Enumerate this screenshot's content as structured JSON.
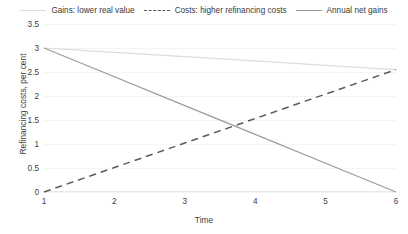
{
  "chart_data": {
    "type": "line",
    "title": "",
    "xlabel": "Time",
    "ylabel": "Refinancing costs, per cent",
    "x": [
      1,
      2,
      3,
      4,
      5,
      6
    ],
    "xlim": [
      1,
      6
    ],
    "ylim": [
      0,
      3.5
    ],
    "xticks": [
      "1",
      "2",
      "3",
      "4",
      "5",
      "6"
    ],
    "yticks": [
      "0",
      "0.5",
      "1",
      "1.5",
      "2",
      "2.5",
      "3",
      "3.5"
    ],
    "ytick_values": [
      0,
      0.5,
      1,
      1.5,
      2,
      2.5,
      3,
      3.5
    ],
    "grid": true,
    "legend_position": "top",
    "series": [
      {
        "name": "Gains: lower real value",
        "values": [
          3.0,
          2.91,
          2.82,
          2.73,
          2.64,
          2.55
        ],
        "style": "solid",
        "color": "#dcdcdc"
      },
      {
        "name": "Costs: higher refinancing costs",
        "values": [
          0.0,
          0.51,
          1.02,
          1.53,
          2.04,
          2.55
        ],
        "style": "dashed",
        "color": "#5a5a66"
      },
      {
        "name": "Annual net gains",
        "values": [
          3.0,
          2.4,
          1.8,
          1.2,
          0.6,
          0.0
        ],
        "style": "solid",
        "color": "#9a9a9a"
      }
    ]
  },
  "legend": {
    "items": [
      {
        "label": "Gains: lower real value"
      },
      {
        "label": "Costs: higher refinancing costs"
      },
      {
        "label": "Annual net gains"
      }
    ]
  }
}
